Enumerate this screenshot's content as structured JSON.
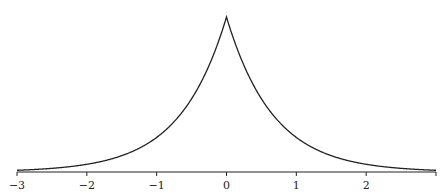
{
  "chart_data": {
    "type": "line",
    "title": "",
    "xlabel": "",
    "ylabel": "",
    "xlim": [
      -3,
      3
    ],
    "ylim": [
      0,
      1
    ],
    "grid": false,
    "legend": null,
    "function": "exp(-1.5*|x|)",
    "x_ticks": [
      -3,
      -2,
      -1,
      0,
      1,
      2
    ],
    "tick_labels": [
      "−3",
      "−2",
      "−1",
      "0",
      "1",
      "2"
    ],
    "series": [
      {
        "name": "laplace-density",
        "x": [
          -3,
          -2.5,
          -2,
          -1.5,
          -1,
          -0.5,
          0,
          0.5,
          1,
          1.5,
          2,
          2.5,
          3
        ],
        "y": [
          0.011,
          0.024,
          0.05,
          0.105,
          0.223,
          0.472,
          1.0,
          0.472,
          0.223,
          0.105,
          0.05,
          0.024,
          0.011
        ]
      }
    ]
  },
  "colors": {
    "line": "#222222",
    "axis": "#222222",
    "background": "#ffffff"
  }
}
